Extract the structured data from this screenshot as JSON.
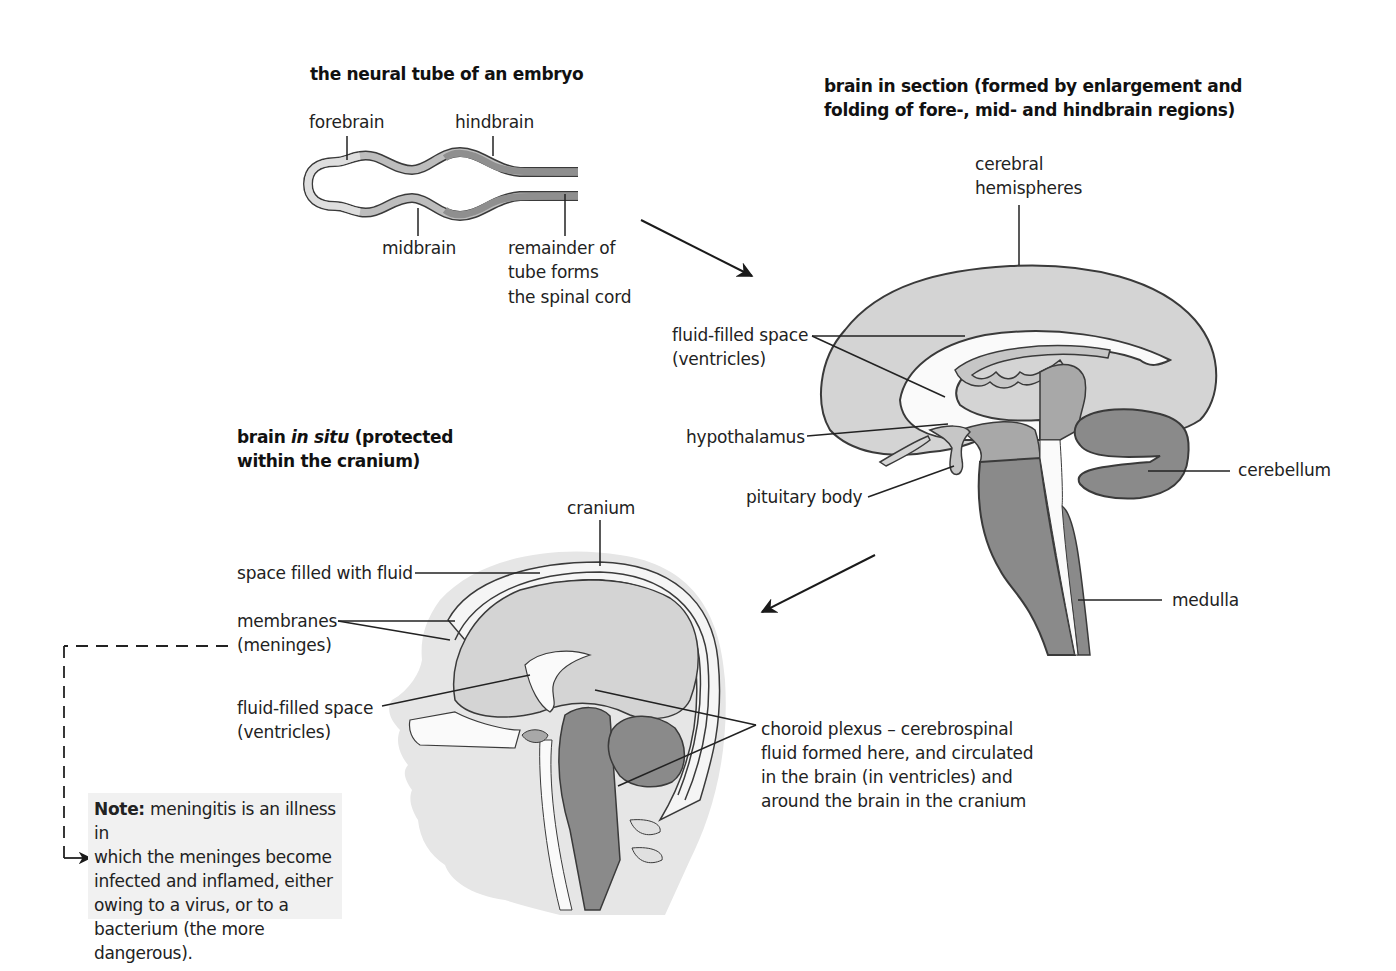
{
  "colors": {
    "light_tissue": "#d6d6d6",
    "mid_tissue": "#a8a8a8",
    "dark_tissue": "#8a8a8a",
    "skin": "#e6e6e6",
    "outline": "#3a3a3a",
    "fluid": "#fafafa",
    "note_bg": "#f1f1f1"
  },
  "neural_tube": {
    "title": "the neural tube of an embryo",
    "labels": {
      "forebrain": "forebrain",
      "hindbrain": "hindbrain",
      "midbrain": "midbrain",
      "remainder_line1": "remainder of",
      "remainder_line2": "tube forms",
      "remainder_line3": "the spinal cord"
    }
  },
  "brain_section": {
    "title_line1": "brain in section (formed by enlargement and",
    "title_line2": "folding of fore-, mid- and hindbrain regions)",
    "labels": {
      "cerebral_line1": "cerebral",
      "cerebral_line2": "hemispheres",
      "ventricles_line1": "fluid-filled space",
      "ventricles_line2": "(ventricles)",
      "hypothalamus": "hypothalamus",
      "pituitary": "pituitary body",
      "cerebellum": "cerebellum",
      "medulla": "medulla"
    }
  },
  "brain_in_situ": {
    "title_bold1": "brain ",
    "title_italic": "in situ",
    "title_bold2": " (protected",
    "title_line2": "within the cranium)",
    "labels": {
      "cranium": "cranium",
      "space_fluid": "space filled with fluid",
      "membranes_line1": "membranes",
      "membranes_line2": "(meninges)",
      "ventricles_line1": "fluid-filled space",
      "ventricles_line2": "(ventricles)",
      "choroid_line1": "choroid plexus – cerebrospinal",
      "choroid_line2": "fluid formed here, and circulated",
      "choroid_line3": "in the brain (in ventricles) and",
      "choroid_line4": "around the brain in the cranium"
    }
  },
  "note": {
    "bold": "Note:",
    "text_line1": " meningitis is an illness in",
    "text_line2": "which the meninges become",
    "text_line3": "infected and inflamed, either",
    "text_line4": "owing to a virus, or to a",
    "text_line5": "bacterium (the more dangerous)."
  }
}
